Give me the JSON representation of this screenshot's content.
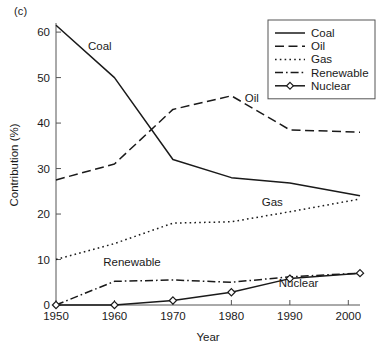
{
  "panel": {
    "label": "(c)"
  },
  "chart_data": {
    "type": "line",
    "title": "",
    "subtitle": "",
    "xlabel": "Year",
    "ylabel": "Contribution (%)",
    "xlim": [
      1950,
      2002
    ],
    "ylim": [
      0,
      62
    ],
    "xticks": [
      1950,
      1960,
      1970,
      1980,
      1990,
      2000
    ],
    "xticklabels": [
      "1950",
      "1960",
      "1970",
      "1980",
      "1990",
      "2000"
    ],
    "yticks": [
      0,
      10,
      20,
      30,
      40,
      50,
      60
    ],
    "yticklabels": [
      "0",
      "10",
      "20",
      "30",
      "40",
      "50",
      "60"
    ],
    "grid": false,
    "legend_position": "top-right",
    "x": [
      1950,
      1960,
      1970,
      1980,
      1990,
      2002
    ],
    "series": [
      {
        "name": "Coal",
        "style": "solid",
        "marker": "none",
        "values": [
          61.5,
          50.0,
          32.0,
          28.0,
          26.8,
          24.0
        ]
      },
      {
        "name": "Oil",
        "style": "dashed",
        "marker": "none",
        "values": [
          27.5,
          31.0,
          43.0,
          46.0,
          38.5,
          38.0
        ]
      },
      {
        "name": "Gas",
        "style": "dotted",
        "marker": "none",
        "values": [
          10.0,
          13.5,
          18.0,
          18.3,
          20.5,
          23.3
        ]
      },
      {
        "name": "Renewable",
        "style": "dashdot",
        "marker": "none",
        "values": [
          0.0,
          5.2,
          5.5,
          5.0,
          6.2,
          7.0
        ]
      },
      {
        "name": "Nuclear",
        "style": "solid",
        "marker": "diamond",
        "values": [
          0.0,
          0.0,
          1.0,
          2.8,
          5.8,
          7.0
        ]
      }
    ],
    "annotations": [
      {
        "text": "Coal",
        "x": 1957.5,
        "y": 56.0
      },
      {
        "text": "Oil",
        "x": 1983.5,
        "y": 44.7
      },
      {
        "text": "Gas",
        "x": 1987.0,
        "y": 21.8
      },
      {
        "text": "Renewable",
        "x": 1963.0,
        "y": 8.6
      },
      {
        "text": "Nuclear",
        "x": 1991.5,
        "y": 3.9
      }
    ]
  },
  "legend": {
    "entries": [
      {
        "label": "Coal",
        "style": "solid",
        "marker": "none"
      },
      {
        "label": "Oil",
        "style": "dashed",
        "marker": "none"
      },
      {
        "label": "Gas",
        "style": "dotted",
        "marker": "none"
      },
      {
        "label": "Renewable",
        "style": "dashdot",
        "marker": "none"
      },
      {
        "label": "Nuclear",
        "style": "solid",
        "marker": "diamond"
      }
    ]
  },
  "colors": {
    "ink": "#1a1a1a",
    "axis": "#555555",
    "background": "#ffffff"
  }
}
